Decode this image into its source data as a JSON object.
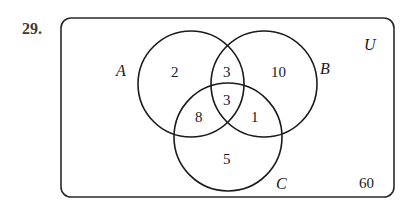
{
  "problem": {
    "number": "29."
  },
  "diagram": {
    "universe_label": "U",
    "outside_count": "60",
    "sets": [
      {
        "name": "A",
        "label": "A"
      },
      {
        "name": "B",
        "label": "B"
      },
      {
        "name": "C",
        "label": "C"
      }
    ],
    "regions": {
      "a_only": "2",
      "b_only": "10",
      "c_only": "5",
      "a_and_b_only": "3",
      "a_and_c_only": "8",
      "b_and_c_only": "1",
      "a_and_b_and_c": "3",
      "outside": "60"
    },
    "colors": {
      "stroke": "#1a1a1a",
      "background": "#ffffff"
    }
  }
}
